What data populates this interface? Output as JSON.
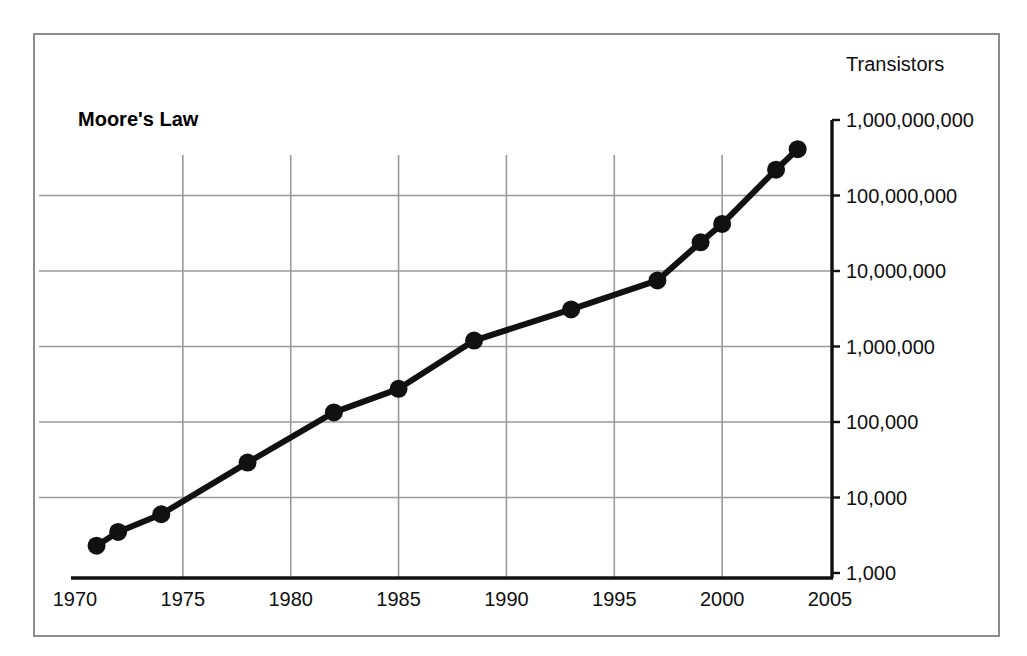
{
  "chart_data": {
    "type": "line",
    "title": "Moore's Law",
    "xlabel": "",
    "ylabel": "Transistors",
    "yscale": "log",
    "xlim": [
      1970,
      2005
    ],
    "ylim": [
      1000,
      1000000000
    ],
    "grid": true,
    "legend": false,
    "x_ticks": [
      "1970",
      "1975",
      "1980",
      "1985",
      "1990",
      "1995",
      "2000",
      "2005"
    ],
    "x_tick_values": [
      1970,
      1975,
      1980,
      1985,
      1990,
      1995,
      2000,
      2005
    ],
    "y_ticks": [
      "1,000,000,000",
      "100,000,000",
      "10,000,000",
      "1,000,000",
      "100,000",
      "10,000",
      "1,000"
    ],
    "y_tick_values": [
      1000000000,
      100000000,
      10000000,
      1000000,
      100000,
      10000,
      1000
    ],
    "series": [
      {
        "name": "Transistors",
        "color": "#111111",
        "marker": "circle",
        "x": [
          1971,
          1972,
          1974,
          1978,
          1982,
          1985,
          1988.5,
          1993,
          1997,
          1999,
          2000,
          2002.5,
          2003.5
        ],
        "y": [
          2300,
          3500,
          6000,
          29000,
          134000,
          275000,
          1200000,
          3100000,
          7500000,
          24000000,
          42000000,
          220000000,
          410000000
        ]
      }
    ]
  },
  "labels": {
    "axis_title": "Transistors",
    "chart_title": "Moore's Law"
  }
}
